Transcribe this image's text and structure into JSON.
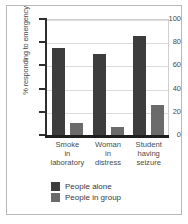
{
  "chart_data": {
    "type": "bar",
    "title": "",
    "xlabel": "",
    "ylabel": "% responding to emergency",
    "ylim": [
      0,
      100
    ],
    "yticks": [
      0,
      20,
      40,
      60,
      80,
      100
    ],
    "grid": true,
    "legend_position": "bottom",
    "categories": [
      "Smoke\nin\nlaboratory",
      "Woman\nin\ndistress",
      "Student\nhaving\nseizure"
    ],
    "category_lines": [
      [
        "Smoke",
        "in",
        "laboratory"
      ],
      [
        "Woman",
        "in",
        "distress"
      ],
      [
        "Student",
        "having",
        "seizure"
      ]
    ],
    "series": [
      {
        "name": "People alone",
        "color": "#3d3d3d",
        "values": [
          75,
          70,
          85
        ]
      },
      {
        "name": "People in group",
        "color": "#6b6b6b",
        "values": [
          10,
          7,
          26
        ]
      }
    ]
  },
  "axis": {
    "tick_labels": [
      "100",
      "80",
      "60",
      "40",
      "20",
      "0"
    ]
  },
  "legend": {
    "items": [
      {
        "label": "People alone"
      },
      {
        "label": "People in group"
      }
    ]
  }
}
